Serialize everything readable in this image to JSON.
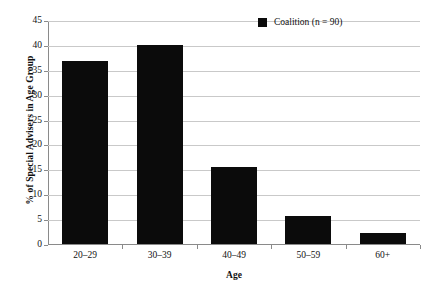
{
  "chart_data": {
    "type": "bar",
    "title": "",
    "categories": [
      "20–29",
      "30–39",
      "40–49",
      "50–59",
      "60+"
    ],
    "values": [
      36.7,
      40.0,
      15.5,
      5.6,
      2.2
    ],
    "series": [
      {
        "name": "Coalition (n = 90)",
        "values": [
          36.7,
          40.0,
          15.5,
          5.6,
          2.2
        ],
        "color": "#0b0b0b"
      }
    ],
    "xlabel": "Age",
    "ylabel": "% of Special Advisers in Age Group",
    "ylim": [
      0,
      45
    ],
    "ytick_step": 5,
    "yticks": [
      "0",
      "5",
      "10",
      "15",
      "20",
      "25",
      "30",
      "35",
      "40",
      "45"
    ],
    "grid": true,
    "grid_axis": "y",
    "legend_position": "top-right",
    "legend": [
      {
        "label": "Coalition (n = 90)",
        "color": "#0b0b0b",
        "marker": "square"
      }
    ],
    "background_color": "#ffffff",
    "grid_color": "#c9c9c9",
    "axis_color": "#8a8a8a"
  }
}
